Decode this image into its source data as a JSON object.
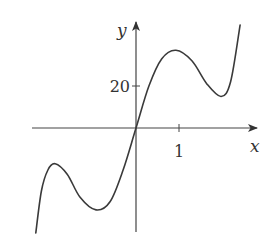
{
  "chart_data": {
    "type": "line",
    "title": "",
    "xlabel": "x",
    "ylabel": "y",
    "x_ticks": [
      {
        "value": 1,
        "label": "1"
      }
    ],
    "y_ticks": [
      {
        "value": 20,
        "label": "20"
      }
    ],
    "xlim": [
      -2.35,
      2.5
    ],
    "ylim": [
      -50,
      50
    ],
    "grid": false,
    "legend": null,
    "series": [
      {
        "name": "f(x)",
        "points": [
          {
            "x": -2.33,
            "y": -50
          },
          {
            "x": -2.2,
            "y": -30
          },
          {
            "x": -2.05,
            "y": -20
          },
          {
            "x": -1.88,
            "y": -17
          },
          {
            "x": -1.6,
            "y": -22
          },
          {
            "x": -1.3,
            "y": -33
          },
          {
            "x": -0.93,
            "y": -39
          },
          {
            "x": -0.6,
            "y": -35
          },
          {
            "x": -0.3,
            "y": -20
          },
          {
            "x": 0,
            "y": 0
          },
          {
            "x": 0.3,
            "y": 20
          },
          {
            "x": 0.6,
            "y": 33
          },
          {
            "x": 0.93,
            "y": 37
          },
          {
            "x": 1.3,
            "y": 32
          },
          {
            "x": 1.65,
            "y": 21
          },
          {
            "x": 1.98,
            "y": 15
          },
          {
            "x": 2.2,
            "y": 22
          },
          {
            "x": 2.42,
            "y": 49
          }
        ]
      }
    ],
    "features": {
      "local_max_right": {
        "x": 0.93,
        "y": 37
      },
      "local_min_right": {
        "x": 1.98,
        "y": 15
      },
      "local_max_left": {
        "x": -1.88,
        "y": -17
      },
      "local_min_left": {
        "x": -0.93,
        "y": -39
      },
      "passes_through_origin": true
    }
  },
  "axes": {
    "x_label": "x",
    "y_label": "y",
    "x_tick_label": "1",
    "y_tick_label": "20"
  }
}
